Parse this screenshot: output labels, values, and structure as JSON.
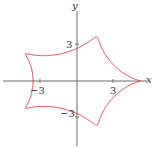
{
  "figure": {
    "axis_labels": {
      "x": "x",
      "y": "y"
    },
    "ticks": {
      "x_pos": "3",
      "x_neg": "−3",
      "y_pos": "3",
      "y_neg": "−3"
    },
    "colors": {
      "curve": "#d9383a",
      "axes": "#6e6e6e"
    },
    "curve": {
      "type": "parametric",
      "description": "closed parametric curve with interwoven oval bands",
      "x_extent": [
        -5.2,
        5.2
      ],
      "y_extent": [
        -3.8,
        3.8
      ]
    },
    "origin_px": [
      77,
      81
    ],
    "unit_px": 12.2
  }
}
